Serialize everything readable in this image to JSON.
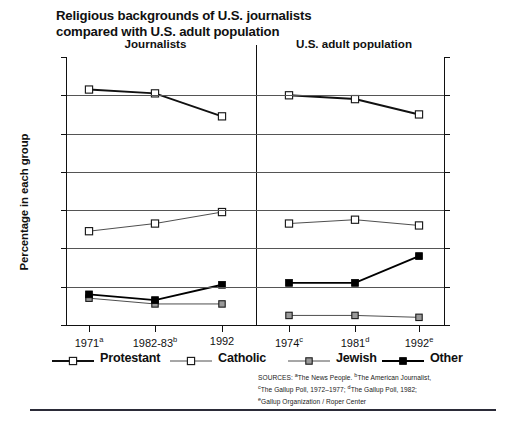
{
  "title": {
    "line1": "Religious backgrounds of U.S. journalists",
    "line2": "compared with U.S. adult population"
  },
  "axis": {
    "ylabel": "Percentage in each group",
    "yticks": [
      "70",
      "60",
      "50",
      "40",
      "30",
      "20",
      "10",
      "0"
    ]
  },
  "panels": [
    {
      "name": "Journalists",
      "xticks": [
        "1971",
        "1982-83",
        "1992"
      ],
      "xsup": [
        "a",
        "b",
        ""
      ]
    },
    {
      "name": "U.S. adult population",
      "xticks": [
        "1974",
        "1981",
        "1992"
      ],
      "xsup": [
        "c",
        "d",
        "e"
      ]
    }
  ],
  "legend": [
    {
      "label": "Protestant",
      "marker": "open-square",
      "line": "thick"
    },
    {
      "label": "Catholic",
      "marker": "open-square",
      "line": "thin"
    },
    {
      "label": "Jewish",
      "marker": "gray-square",
      "line": "thin"
    },
    {
      "label": "Other",
      "marker": "filled-square",
      "line": "thick"
    }
  ],
  "sources": {
    "line1_a": "SOURCES: ",
    "line1_b": "The News People. ",
    "line1_c": "The American Journalist,",
    "line2_a": "The Gallup Poll, 1972–1977; ",
    "line2_b": "The Gallup Poll, 1982;",
    "line3_a": "Gallup Organization / Roper Center",
    "sup_a": "a",
    "sup_b": "b",
    "sup_c": "c",
    "sup_d": "d",
    "sup_e": "e"
  },
  "chart_data": {
    "type": "line",
    "title": "Religious backgrounds of U.S. journalists compared with U.S. adult population",
    "xlabel": "",
    "ylabel": "Percentage in each group",
    "ylim": [
      0,
      70
    ],
    "ytick_step": 10,
    "grid": true,
    "legend_position": "bottom",
    "panels": [
      {
        "name": "Journalists",
        "categories": [
          "1971",
          "1982-83",
          "1992"
        ],
        "series": [
          {
            "name": "Protestant",
            "values": [
              61.5,
              60.5,
              54.5
            ]
          },
          {
            "name": "Catholic",
            "values": [
              24.5,
              26.5,
              29.5
            ]
          },
          {
            "name": "Jewish",
            "values": [
              7.0,
              5.5,
              5.5
            ]
          },
          {
            "name": "Other",
            "values": [
              8.0,
              6.5,
              10.5
            ]
          }
        ]
      },
      {
        "name": "U.S. adult population",
        "categories": [
          "1974",
          "1981",
          "1992"
        ],
        "series": [
          {
            "name": "Protestant",
            "values": [
              60.0,
              59.0,
              55.0
            ]
          },
          {
            "name": "Catholic",
            "values": [
              26.5,
              27.5,
              26.0
            ]
          },
          {
            "name": "Jewish",
            "values": [
              2.5,
              2.5,
              2.0
            ]
          },
          {
            "name": "Other",
            "values": [
              11.0,
              11.0,
              18.0
            ]
          }
        ]
      }
    ],
    "colors": {
      "protestant": "#111111",
      "catholic": "#333333",
      "jewish": "#444444",
      "other": "#000000",
      "grid": "#555555",
      "axis": "#111111"
    }
  }
}
